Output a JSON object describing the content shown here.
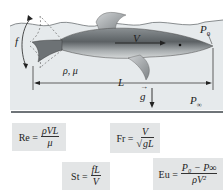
{
  "figure": {
    "labels": {
      "frequency": "f",
      "velocity": "V",
      "surface_pressure": "P",
      "surface_pressure_sub": "0",
      "fluid_properties": "ρ, μ",
      "length": "L",
      "gravity": "g",
      "ambient_pressure": "P",
      "ambient_pressure_sub": "∞"
    },
    "colors": {
      "water": "#e6eaec",
      "dolphin_dark": "#5c6164",
      "dolphin_light": "#c9cdcf",
      "line": "#2a2a2a",
      "formula_box": "#e3e5e6"
    }
  },
  "formulas": {
    "re": {
      "lhs": "Re =",
      "num": "ρVL",
      "den": "μ"
    },
    "fr": {
      "lhs": "Fr =",
      "num": "V",
      "den_prefix": "√",
      "den": "gL"
    },
    "st": {
      "lhs": "St =",
      "num": "fL",
      "den": "V"
    },
    "eu": {
      "lhs": "Eu =",
      "num": "P₀ − P∞",
      "den": "ρV²"
    }
  }
}
